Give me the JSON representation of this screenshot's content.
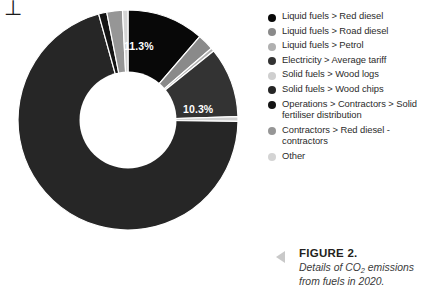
{
  "page": {
    "artifact_mark": "⊥"
  },
  "chart_data": {
    "type": "pie",
    "variant": "donut",
    "title": "Details of CO2 emissions from fuels in 2020.",
    "xlabel": "",
    "ylabel": "",
    "unit": "%",
    "grid": false,
    "legend_position": "right",
    "categories": [
      "Liquid fuels > Red diesel",
      "Liquid fuels > Road diesel",
      "Liquid fuels > Petrol",
      "Electricity > Average tariff",
      "Solid fuels > Wood logs",
      "Solid fuels > Wood chips",
      "Operations > Contractors > Solid fertiliser distribution",
      "Contractors > Red diesel - contractors",
      "Other"
    ],
    "values": [
      11.3,
      2.4,
      0.5,
      10.3,
      0.7,
      70.5,
      1.2,
      2.3,
      0.8
    ],
    "colors": [
      "#080808",
      "#8a8a8a",
      "#b0b0b0",
      "#333333",
      "#cfcfcf",
      "#262626",
      "#141414",
      "#969696",
      "#d4d4d4"
    ],
    "data_labels": [
      {
        "index": 0,
        "text": "11.3%"
      },
      {
        "index": 3,
        "text": "10.3%"
      },
      {
        "index": 5,
        "text": "70.5%"
      }
    ],
    "start_angle_deg": -90,
    "inner_radius_ratio": 0.44
  },
  "legend": {
    "items": [
      {
        "label": "Liquid fuels > Red diesel",
        "color": "#080808",
        "icon": "legend-dot-icon"
      },
      {
        "label": "Liquid fuels > Road diesel",
        "color": "#8a8a8a",
        "icon": "legend-dot-icon"
      },
      {
        "label": "Liquid fuels > Petrol",
        "color": "#b0b0b0",
        "icon": "legend-dot-icon"
      },
      {
        "label": "Electricity > Average tariff",
        "color": "#333333",
        "icon": "legend-dot-icon"
      },
      {
        "label": "Solid fuels > Wood logs",
        "color": "#cfcfcf",
        "icon": "legend-dot-icon"
      },
      {
        "label": "Solid fuels > Wood chips",
        "color": "#262626",
        "icon": "legend-dot-icon"
      },
      {
        "label": "Operations > Contractors > Solid fertiliser distribution",
        "color": "#141414",
        "icon": "legend-dot-icon"
      },
      {
        "label": "Contractors > Red diesel - contractors",
        "color": "#969696",
        "icon": "legend-dot-icon"
      },
      {
        "label": "Other",
        "color": "#d4d4d4",
        "icon": "legend-dot-icon"
      }
    ]
  },
  "caption": {
    "arrow_icon": "triangle-left-icon",
    "title": "FIGURE 2.",
    "description_part1": "Details of CO",
    "description_sub": "2",
    "description_part2": " emissions from fuels in 2020."
  }
}
